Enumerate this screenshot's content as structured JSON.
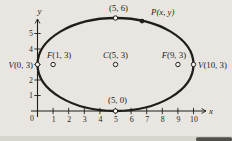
{
  "page": {
    "background": "#e9e6e1",
    "bottom_band_color": "#d8d5cf",
    "smudge_color": "#3a3834"
  },
  "figure": {
    "ink": "#201e1b",
    "marker_fill": "#f6f4ef",
    "transform": {
      "origin_px": [
        37.5,
        111
      ],
      "scale_px": [
        15.6,
        15.5
      ]
    },
    "axes": {
      "x_label": "x",
      "y_label": "y",
      "origin_label": "0",
      "x_range_px": [
        31,
        206
      ],
      "y_range_px": [
        19,
        117
      ],
      "x_ticks": [
        {
          "v": 1,
          "label": "1"
        },
        {
          "v": 2,
          "label": "2"
        },
        {
          "v": 3,
          "label": "3"
        },
        {
          "v": 4,
          "label": "4"
        },
        {
          "v": 5,
          "label": "5"
        },
        {
          "v": 6,
          "label": "6"
        },
        {
          "v": 7,
          "label": "7"
        },
        {
          "v": 8,
          "label": "8"
        },
        {
          "v": 9,
          "label": "9"
        },
        {
          "v": 10,
          "label": "10"
        }
      ],
      "y_ticks": [
        {
          "v": 1,
          "label": "1"
        },
        {
          "v": 2,
          "label": "2"
        },
        {
          "v": 3,
          "label": ""
        },
        {
          "v": 4,
          "label": "4"
        },
        {
          "v": 5,
          "label": "5"
        }
      ]
    },
    "ellipse": {
      "cx": 5,
      "cy": 3,
      "rx": 5,
      "ry": 3,
      "stroke_width": 2.3
    },
    "points": [
      {
        "name": "covertex-top",
        "lead": "",
        "rest": "(5, 6)",
        "style": "roman",
        "x": 5,
        "y": 6,
        "marker": "open",
        "anchor": "middle",
        "dx": 3,
        "dy": -7
      },
      {
        "name": "point-p",
        "lead": "P",
        "rest": "(x, y)",
        "style": "italic",
        "x": 6.7,
        "y": 5.8,
        "marker": "filled",
        "anchor": "start",
        "dx": 9,
        "dy": -6
      },
      {
        "name": "vertex-left",
        "lead": "V",
        "rest": "(0, 3)",
        "style": "mixed",
        "x": 0,
        "y": 3,
        "marker": "open",
        "anchor": "end",
        "dx": -4.5,
        "dy": 3
      },
      {
        "name": "vertex-right",
        "lead": "V",
        "rest": "(10, 3)",
        "style": "mixed",
        "x": 10,
        "y": 3,
        "marker": "open",
        "anchor": "start",
        "dx": 4.5,
        "dy": 3
      },
      {
        "name": "focus-left",
        "lead": "F",
        "rest": "(1, 3)",
        "style": "mixed",
        "x": 1,
        "y": 3,
        "marker": "open",
        "anchor": "middle",
        "dx": 6,
        "dy": -7
      },
      {
        "name": "focus-right",
        "lead": "F",
        "rest": "(9, 3)",
        "style": "mixed",
        "x": 9,
        "y": 3,
        "marker": "open",
        "anchor": "middle",
        "dx": -4,
        "dy": -7
      },
      {
        "name": "center-point",
        "lead": "C",
        "rest": "(5, 3)",
        "style": "mixed",
        "x": 5,
        "y": 3,
        "marker": "open",
        "anchor": "middle",
        "dx": 0,
        "dy": -7
      },
      {
        "name": "covertex-bottom",
        "lead": "",
        "rest": "(5, 0)",
        "style": "roman",
        "x": 5,
        "y": 0,
        "marker": "open",
        "anchor": "middle",
        "dx": 2,
        "dy": -8
      }
    ],
    "font": {
      "tick_size": 7.8,
      "label_size": 8.8,
      "axis_letter_size": 9
    }
  }
}
